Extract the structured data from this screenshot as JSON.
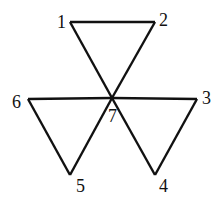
{
  "diagram": {
    "type": "graph",
    "nodes": [
      {
        "id": "1",
        "label": "1",
        "x": 70,
        "y": 22,
        "lx": 57,
        "ly": 28
      },
      {
        "id": "2",
        "label": "2",
        "x": 155,
        "y": 22,
        "lx": 159,
        "ly": 26
      },
      {
        "id": "3",
        "label": "3",
        "x": 197,
        "y": 99,
        "lx": 202,
        "ly": 104
      },
      {
        "id": "4",
        "label": "4",
        "x": 155,
        "y": 175,
        "lx": 159,
        "ly": 192
      },
      {
        "id": "5",
        "label": "5",
        "x": 70,
        "y": 175,
        "lx": 76,
        "ly": 192
      },
      {
        "id": "6",
        "label": "6",
        "x": 28,
        "y": 99,
        "lx": 12,
        "ly": 108
      },
      {
        "id": "7",
        "label": "7",
        "x": 112,
        "y": 98,
        "lx": 108,
        "ly": 122
      }
    ],
    "edges": [
      [
        "1",
        "2"
      ],
      [
        "1",
        "7"
      ],
      [
        "2",
        "7"
      ],
      [
        "6",
        "7"
      ],
      [
        "6",
        "5"
      ],
      [
        "5",
        "7"
      ],
      [
        "7",
        "3"
      ],
      [
        "3",
        "4"
      ],
      [
        "4",
        "7"
      ]
    ],
    "colors": {
      "stroke": "#111111",
      "background": "#ffffff"
    }
  }
}
